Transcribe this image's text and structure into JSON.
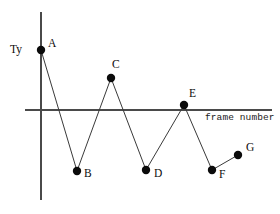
{
  "figure": {
    "background_color": "#ffffff",
    "width": 280,
    "height": 214
  },
  "axes": {
    "y_axis_label": "Ty",
    "x_axis_label": "frame number",
    "axis_color": "#4a4a4a",
    "x_axis_y_pixel": 110,
    "y_axis_x_pixel": 41,
    "x_axis_start_px": 25,
    "x_axis_end_px": 272,
    "y_axis_start_px": 12,
    "y_axis_end_px": 200
  },
  "series_style": {
    "line_color": "#3a3a3a",
    "marker_color": "#0b0b0b",
    "marker_radius": 4.2
  },
  "chart_data": {
    "type": "line",
    "title": "",
    "xlabel": "frame number",
    "ylabel": "Ty",
    "grid": false,
    "legend": false,
    "x": [
      1,
      2,
      3,
      4,
      5,
      6,
      7
    ],
    "values": [
      60,
      -61,
      32,
      -60,
      5,
      -60,
      -45
    ],
    "point_labels": [
      "A",
      "B",
      "C",
      "D",
      "E",
      "F",
      "G"
    ],
    "points": [
      {
        "label": "A",
        "x": 41,
        "y": 50,
        "label_dx": 7,
        "label_dy": -12
      },
      {
        "label": "B",
        "x": 77,
        "y": 171,
        "label_dx": 7,
        "label_dy": -3
      },
      {
        "label": "C",
        "x": 111,
        "y": 78,
        "label_dx": 1,
        "label_dy": -19
      },
      {
        "label": "D",
        "x": 146,
        "y": 170,
        "label_dx": 8,
        "label_dy": -2
      },
      {
        "label": "E",
        "x": 184,
        "y": 105,
        "label_dx": 5,
        "label_dy": -17
      },
      {
        "label": "F",
        "x": 212,
        "y": 170,
        "label_dx": 7,
        "label_dy": -1
      },
      {
        "label": "G",
        "x": 238,
        "y": 155,
        "label_dx": 8,
        "label_dy": -13
      }
    ],
    "annotations": [
      {
        "name": "y-axis-label",
        "text": "Ty",
        "x": 10,
        "y": 44
      },
      {
        "name": "x-axis-label",
        "text": "frame number",
        "x": 205,
        "y": 113
      }
    ]
  }
}
